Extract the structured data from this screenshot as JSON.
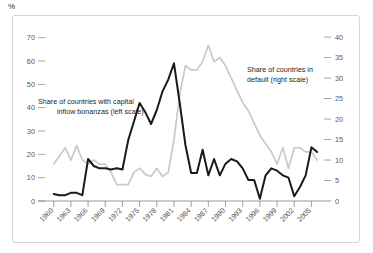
{
  "unit_label": "%",
  "legend": {
    "left_series": "Share of countries with capital inflow bonanzas (left scale)",
    "left_series_line1": "Share of countries with capital",
    "left_series_line2": "inflow bonanzas (left scale)",
    "right_series": "Share of countries in default (right scale)",
    "right_series_line1": "Share of countries in",
    "right_series_line2": "default (right scale)"
  },
  "colors": {
    "left_series_color": "#1a1a1a",
    "right_series_color": "#c9c9c9",
    "frame_border": "#d6d3d0",
    "axis": "#8c8c8e",
    "tick_text": "#58585a"
  },
  "chart_data": {
    "type": "line",
    "title": "%",
    "xlabel": "",
    "ylabel": "%",
    "grid": false,
    "legend_position": "inline-annotation",
    "x": [
      1960,
      1961,
      1962,
      1963,
      1964,
      1965,
      1966,
      1967,
      1968,
      1969,
      1970,
      1971,
      1972,
      1973,
      1974,
      1975,
      1976,
      1977,
      1978,
      1979,
      1980,
      1981,
      1982,
      1983,
      1984,
      1985,
      1986,
      1987,
      1988,
      1989,
      1990,
      1991,
      1992,
      1993,
      1994,
      1995,
      1996,
      1997,
      1998,
      1999,
      2000,
      2001,
      2002,
      2003,
      2004,
      2005,
      2006
    ],
    "xtick_labels": [
      "1960",
      "1963",
      "1966",
      "1969",
      "1972",
      "1975",
      "1978",
      "1981",
      "1984",
      "1987",
      "1990",
      "1993",
      "1996",
      "1999",
      "2002",
      "2005"
    ],
    "xtick_values": [
      1960,
      1963,
      1966,
      1969,
      1972,
      1975,
      1978,
      1981,
      1984,
      1987,
      1990,
      1993,
      1996,
      1999,
      2002,
      2005
    ],
    "xlim": [
      1959,
      2006.5
    ],
    "left_axis": {
      "label": "Share of countries with capital inflow bonanzas (left scale)",
      "ylim": [
        0,
        72
      ],
      "ticks": [
        0,
        10,
        20,
        30,
        40,
        50,
        60,
        70
      ],
      "tick_labels": [
        "0",
        "10",
        "20",
        "30",
        "40",
        "50",
        "60",
        "70"
      ]
    },
    "right_axis": {
      "label": "Share of countries in default (right scale)",
      "ylim": [
        0,
        41
      ],
      "ticks": [
        0,
        5,
        10,
        15,
        20,
        25,
        30,
        35,
        40
      ],
      "tick_labels": [
        "0",
        "5",
        "10",
        "15",
        "20",
        "25",
        "30",
        "35",
        "40"
      ]
    },
    "series": [
      {
        "name": "Share of countries with capital inflow bonanzas (left scale)",
        "axis": "left",
        "color": "#1a1a1a",
        "values": [
          3,
          2.5,
          2.5,
          3.5,
          3.5,
          2.5,
          18,
          15,
          14,
          14,
          13.5,
          14,
          13.5,
          26,
          34,
          42,
          38,
          33,
          39,
          47,
          52,
          59,
          42,
          24,
          12,
          12,
          22,
          11,
          18,
          11,
          16,
          18,
          17,
          14,
          9,
          9,
          1,
          11,
          14,
          13,
          11,
          10,
          2,
          6,
          11,
          23,
          21
        ]
      },
      {
        "name": "Share of countries in default (right scale)",
        "axis": "right",
        "color": "#c9c9c9",
        "values": [
          9,
          11,
          13,
          10,
          13.5,
          10,
          9,
          10,
          9,
          9,
          7,
          4,
          4,
          4,
          7,
          8,
          6.5,
          6,
          8,
          6,
          7,
          15,
          26,
          33,
          32,
          32,
          34,
          38,
          34,
          35,
          33,
          30,
          27,
          24,
          22,
          19,
          16,
          14,
          12,
          9,
          13,
          8,
          13,
          13,
          12,
          12,
          10
        ]
      }
    ]
  }
}
